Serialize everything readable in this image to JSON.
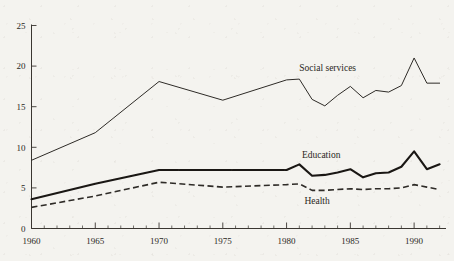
{
  "chart_data": {
    "type": "line",
    "title": "",
    "subtitle": "",
    "xlabel": "",
    "ylabel": "",
    "xlim": [
      1960,
      1992.5
    ],
    "ylim": [
      0,
      25
    ],
    "grid": false,
    "legend_position": "inline-annotations",
    "y_ticks": [
      0,
      5,
      10,
      15,
      20,
      25
    ],
    "y_tick_labels": [
      "0",
      "5",
      "10",
      "15",
      "20",
      "25"
    ],
    "x_ticks": [
      1960,
      1965,
      1970,
      1975,
      1980,
      1985,
      1990
    ],
    "x_tick_labels": [
      "1960",
      "1965",
      "1970",
      "1975",
      "1980",
      "1985",
      "1990"
    ],
    "x_minor_tick_interval": 1,
    "series": [
      {
        "name": "Social services",
        "style": "thin-solid",
        "color": "#2e2b27",
        "label_x": 1981.0,
        "label_y": 19.4,
        "x": [
          1960,
          1965,
          1970,
          1975,
          1980,
          1981,
          1982,
          1983,
          1984,
          1985,
          1986,
          1987,
          1988,
          1989,
          1990,
          1991,
          1992
        ],
        "values": [
          8.4,
          11.8,
          18.1,
          15.8,
          18.3,
          18.4,
          15.9,
          15.1,
          16.4,
          17.5,
          16.1,
          17.0,
          16.8,
          17.6,
          21.0,
          17.9,
          17.9
        ]
      },
      {
        "name": "Education",
        "style": "thick-solid",
        "color": "#1a1714",
        "label_x": 1981.2,
        "label_y": 8.7,
        "x": [
          1960,
          1965,
          1970,
          1975,
          1980,
          1981,
          1982,
          1983,
          1984,
          1985,
          1986,
          1987,
          1988,
          1989,
          1990,
          1991,
          1992
        ],
        "values": [
          3.6,
          5.5,
          7.2,
          7.2,
          7.2,
          7.9,
          6.5,
          6.6,
          6.9,
          7.3,
          6.3,
          6.8,
          6.9,
          7.6,
          9.5,
          7.3,
          7.9
        ]
      },
      {
        "name": "Health",
        "style": "dashed",
        "color": "#2e2b27",
        "label_x": 1981.4,
        "label_y": 3.0,
        "x": [
          1960,
          1965,
          1970,
          1975,
          1980,
          1981,
          1982,
          1983,
          1984,
          1985,
          1986,
          1987,
          1988,
          1989,
          1990,
          1991,
          1992
        ],
        "values": [
          2.6,
          4.0,
          5.7,
          5.1,
          5.4,
          5.5,
          4.7,
          4.7,
          4.8,
          4.9,
          4.8,
          4.9,
          4.9,
          5.0,
          5.4,
          5.1,
          4.8
        ]
      }
    ]
  }
}
